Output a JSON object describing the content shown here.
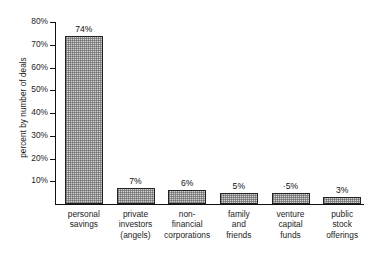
{
  "chart_data": {
    "type": "bar",
    "title": "",
    "subtitle": "",
    "xlabel": "",
    "ylabel": "percent by number of deals",
    "ylim": [
      0,
      80
    ],
    "ytick_values": [
      80,
      70,
      60,
      50,
      40,
      30,
      20,
      10
    ],
    "ytick_labels": [
      "80%",
      "70%",
      "60%",
      "50%",
      "40%",
      "30%",
      "20%",
      "10%"
    ],
    "grid": false,
    "legend": false,
    "legend_position": "none",
    "categories": [
      "personal savings",
      "private investors (angels)",
      "non-financial corporations",
      "family and friends",
      "venture capital funds",
      "public stock offerings"
    ],
    "category_lines": [
      [
        "personal",
        "savings"
      ],
      [
        "private",
        "investors",
        "(angels)"
      ],
      [
        "non-",
        "financial",
        "corporations"
      ],
      [
        "family",
        "and",
        "friends"
      ],
      [
        "venture",
        "capital",
        "funds"
      ],
      [
        "public",
        "stock",
        "offerings"
      ]
    ],
    "values": [
      74,
      7,
      6,
      5,
      5,
      3
    ],
    "data_labels": [
      "74%",
      "7%",
      "6%",
      "5%",
      "·5%",
      "3%"
    ],
    "bar_color": "#d2d2d2",
    "bar_edge_color": "#222222",
    "axis_color": "#111111",
    "text_color": "#1d1d1d",
    "background_color": "#ffffff"
  },
  "axis": {
    "y_title": "percent by number of deals"
  }
}
